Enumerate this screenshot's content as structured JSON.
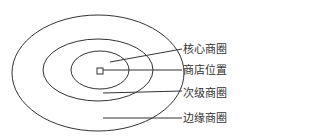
{
  "diagram": {
    "type": "concentric-trade-area-diagram",
    "stroke_color": "#333333",
    "background": "#ffffff",
    "rings": [
      {
        "name": "core",
        "cx": 100,
        "cy": 70,
        "rx": 29,
        "ry": 19
      },
      {
        "name": "secondary",
        "cx": 98,
        "cy": 70,
        "rx": 55,
        "ry": 31
      },
      {
        "name": "fringe",
        "cx": 98,
        "cy": 73,
        "rx": 86,
        "ry": 58
      }
    ],
    "store_marker": {
      "x": 97,
      "y": 68,
      "size": 6
    },
    "labels": [
      {
        "id": "core",
        "text": "核心商圈",
        "x": 183,
        "y": 43,
        "line": [
          110,
          62,
          182,
          49
        ]
      },
      {
        "id": "store",
        "text": "商店位置",
        "x": 183,
        "y": 64,
        "line": [
          103,
          70,
          182,
          70
        ]
      },
      {
        "id": "secondary",
        "text": "次级商圈",
        "x": 183,
        "y": 87,
        "line": [
          103,
          93,
          182,
          91
        ]
      },
      {
        "id": "fringe",
        "text": "边缘商圈",
        "x": 183,
        "y": 112,
        "line": [
          103,
          118,
          182,
          118
        ]
      }
    ]
  }
}
